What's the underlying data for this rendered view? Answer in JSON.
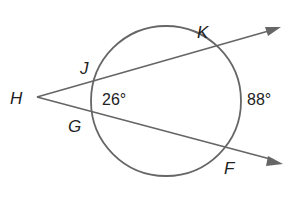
{
  "diagram": {
    "type": "circle-with-two-secants",
    "colors": {
      "stroke": "#666666",
      "text": "#222222",
      "background": "#ffffff"
    },
    "points": {
      "H": {
        "label": "H",
        "x": 37,
        "y": 97
      },
      "J": {
        "label": "J",
        "x": 101,
        "y": 79
      },
      "K": {
        "label": "K",
        "x": 201,
        "y": 49
      },
      "G": {
        "label": "G",
        "x": 93,
        "y": 113
      },
      "F": {
        "label": "F",
        "x": 229,
        "y": 150
      }
    },
    "circle": {
      "cx": 166,
      "cy": 101,
      "r": 75
    },
    "arcs": {
      "near_arc": {
        "label": "26°",
        "between": "J-G"
      },
      "far_arc": {
        "label": "88°",
        "between": "K-F"
      }
    }
  }
}
